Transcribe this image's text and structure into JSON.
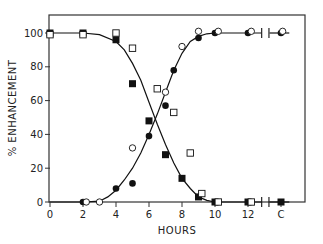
{
  "chart_data": {
    "type": "scatter",
    "title": "",
    "xlabel": "HOURS",
    "ylabel": "% ENHANCEMENT",
    "xlim": [
      0,
      14.5
    ],
    "ylim": [
      0,
      110
    ],
    "x_ticks": [
      {
        "value": 0,
        "label": "0"
      },
      {
        "value": 2,
        "label": "2"
      },
      {
        "value": 4,
        "label": "4"
      },
      {
        "value": 6,
        "label": "6"
      },
      {
        "value": 8,
        "label": "8"
      },
      {
        "value": 10,
        "label": "10"
      },
      {
        "value": 12,
        "label": "12"
      },
      {
        "value": 14,
        "label": "C"
      }
    ],
    "y_ticks": [
      {
        "value": 0,
        "label": "0"
      },
      {
        "value": 20,
        "label": "20"
      },
      {
        "value": 40,
        "label": "40"
      },
      {
        "value": 60,
        "label": "60"
      },
      {
        "value": 80,
        "label": "80"
      },
      {
        "value": 100,
        "label": "100"
      }
    ],
    "axis_break_x": 13.05,
    "grid": false,
    "legend": "none",
    "series": [
      {
        "name": "filled squares",
        "marker": "square-filled",
        "points": [
          [
            0,
            100
          ],
          [
            2,
            100
          ],
          [
            4,
            96
          ],
          [
            5,
            70
          ],
          [
            6,
            48
          ],
          [
            7,
            28
          ],
          [
            8,
            14
          ],
          [
            9,
            3
          ],
          [
            10,
            0
          ],
          [
            12,
            0
          ],
          [
            14,
            0
          ]
        ]
      },
      {
        "name": "open squares",
        "marker": "square-open",
        "points": [
          [
            0,
            99
          ],
          [
            2,
            99
          ],
          [
            4,
            100
          ],
          [
            5,
            91
          ],
          [
            6.5,
            67
          ],
          [
            7.5,
            53
          ],
          [
            8.5,
            29
          ],
          [
            9.2,
            5
          ],
          [
            10.2,
            0
          ],
          [
            12.2,
            0
          ]
        ]
      },
      {
        "name": "filled circles",
        "marker": "circle-filled",
        "points": [
          [
            2,
            0
          ],
          [
            4,
            8
          ],
          [
            5,
            11
          ],
          [
            6,
            39
          ],
          [
            7,
            57
          ],
          [
            7.5,
            78
          ],
          [
            9,
            97
          ],
          [
            10,
            100
          ],
          [
            12,
            100
          ],
          [
            14,
            100
          ]
        ]
      },
      {
        "name": "open circles",
        "marker": "circle-open",
        "points": [
          [
            2.2,
            0
          ],
          [
            3,
            0
          ],
          [
            5,
            32
          ],
          [
            7,
            65
          ],
          [
            8,
            92
          ],
          [
            9,
            101
          ],
          [
            10.2,
            101
          ],
          [
            12.2,
            101
          ],
          [
            14.1,
            101
          ]
        ]
      }
    ],
    "fitted_curves": [
      {
        "name": "decreasing curve",
        "points": [
          [
            0,
            100
          ],
          [
            2,
            100
          ],
          [
            3,
            99
          ],
          [
            4,
            95
          ],
          [
            4.5,
            90
          ],
          [
            5,
            82
          ],
          [
            5.5,
            72
          ],
          [
            6,
            59
          ],
          [
            6.5,
            46
          ],
          [
            7,
            34
          ],
          [
            7.5,
            23
          ],
          [
            8,
            14
          ],
          [
            8.5,
            8
          ],
          [
            9,
            3
          ],
          [
            9.5,
            1
          ],
          [
            10,
            0
          ],
          [
            12,
            0
          ],
          [
            13,
            0
          ],
          [
            14,
            0
          ],
          [
            14.5,
            0
          ]
        ]
      },
      {
        "name": "increasing curve",
        "points": [
          [
            0,
            0
          ],
          [
            2,
            0
          ],
          [
            3,
            0.5
          ],
          [
            3.5,
            3
          ],
          [
            4,
            7
          ],
          [
            4.5,
            13
          ],
          [
            5,
            20
          ],
          [
            5.5,
            29
          ],
          [
            6,
            40
          ],
          [
            6.5,
            52
          ],
          [
            7,
            65
          ],
          [
            7.5,
            78
          ],
          [
            8,
            88
          ],
          [
            8.5,
            95
          ],
          [
            9,
            98
          ],
          [
            9.5,
            99.5
          ],
          [
            10,
            100
          ],
          [
            12,
            100
          ],
          [
            13,
            100
          ],
          [
            14,
            100
          ],
          [
            14.5,
            100
          ]
        ]
      }
    ]
  }
}
